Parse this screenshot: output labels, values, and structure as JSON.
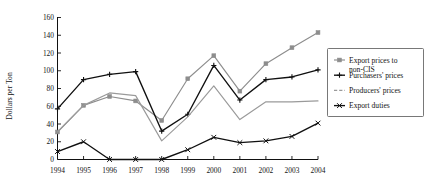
{
  "chart_data": {
    "type": "line",
    "title": "",
    "xlabel": "",
    "ylabel": "Dollars per Ton",
    "categories": [
      "1994",
      "1995",
      "1996",
      "1997",
      "1998",
      "1999",
      "2000",
      "2001",
      "2002",
      "2003",
      "2004"
    ],
    "ylim": [
      0,
      160
    ],
    "ytick_step": 20,
    "yticks": [
      "0",
      "20",
      "40",
      "60",
      "80",
      "100",
      "120",
      "140",
      "160"
    ],
    "grid": false,
    "legend_position": "right",
    "series": [
      {
        "name": "Export prices to non-CIS",
        "color": "#8d8d8d",
        "marker": "square",
        "values": [
          31,
          61,
          71,
          66,
          44,
          91,
          117,
          77,
          108,
          126,
          143
        ]
      },
      {
        "name": "Purchasers' prices",
        "color": "#101010",
        "marker": "plus",
        "values": [
          57,
          90,
          96,
          99,
          32,
          51,
          106,
          67,
          90,
          93,
          101
        ]
      },
      {
        "name": "Producers' prices",
        "color": "#9a9a9a",
        "marker": "none",
        "values": [
          31,
          61,
          75,
          72,
          21,
          48,
          83,
          45,
          65,
          65,
          66
        ]
      },
      {
        "name": "Export duties",
        "color": "#101010",
        "marker": "x",
        "values": [
          9,
          20,
          0,
          0,
          0,
          11,
          25,
          19,
          21,
          26,
          41
        ]
      }
    ]
  },
  "legend": {
    "entries": [
      {
        "label_line1": "Export prices to",
        "label_line2": "non-CIS"
      },
      {
        "label_line1": "Purchasers' prices",
        "label_line2": ""
      },
      {
        "label_line1": "Producers' prices",
        "label_line2": ""
      },
      {
        "label_line1": "Export duties",
        "label_line2": ""
      }
    ]
  }
}
